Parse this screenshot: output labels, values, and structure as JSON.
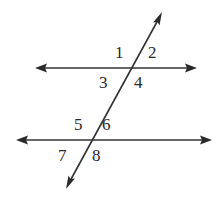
{
  "diagram": {
    "colors": {
      "line": "#333333",
      "text": "#2a2a2a",
      "background": "#ffffff"
    },
    "lines": [
      {
        "id": "parallel-line-top",
        "x1": 35,
        "y1": 68,
        "x2": 197,
        "y2": 68,
        "arrows": "both"
      },
      {
        "id": "parallel-line-bottom",
        "x1": 16,
        "y1": 140,
        "x2": 212,
        "y2": 140,
        "arrows": "both"
      },
      {
        "id": "transversal",
        "x1": 162,
        "y1": 12,
        "x2": 66,
        "y2": 189,
        "arrows": "both"
      }
    ],
    "angles": [
      {
        "label": "1",
        "x": 115,
        "y": 58
      },
      {
        "label": "2",
        "x": 148,
        "y": 58
      },
      {
        "label": "3",
        "x": 99,
        "y": 88
      },
      {
        "label": "4",
        "x": 134,
        "y": 88
      },
      {
        "label": "5",
        "x": 74,
        "y": 130
      },
      {
        "label": "6",
        "x": 102,
        "y": 130
      },
      {
        "label": "7",
        "x": 58,
        "y": 161
      },
      {
        "label": "8",
        "x": 92,
        "y": 161
      }
    ]
  }
}
